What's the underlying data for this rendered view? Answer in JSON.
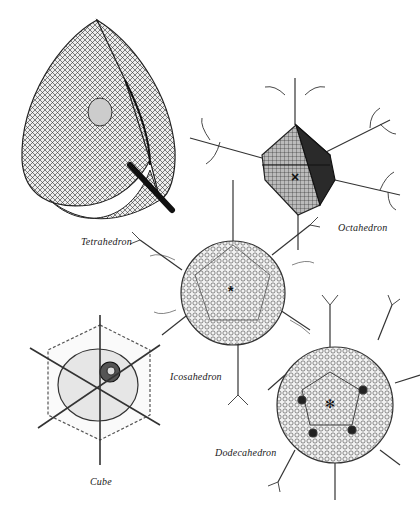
{
  "figure": {
    "background": "#ffffff",
    "ink": "#1a1a1a",
    "specimens": [
      {
        "id": "tetrahedron",
        "label": "Tetrahedron",
        "center_marker": ""
      },
      {
        "id": "octahedron",
        "label": "Octahedron",
        "center_marker": "×"
      },
      {
        "id": "icosahedron",
        "label": "Icosahedron",
        "center_marker": "*"
      },
      {
        "id": "cube",
        "label": "Cube",
        "center_marker": ""
      },
      {
        "id": "dodecahedron",
        "label": "Dodecahedron",
        "center_marker": "✻"
      }
    ]
  }
}
